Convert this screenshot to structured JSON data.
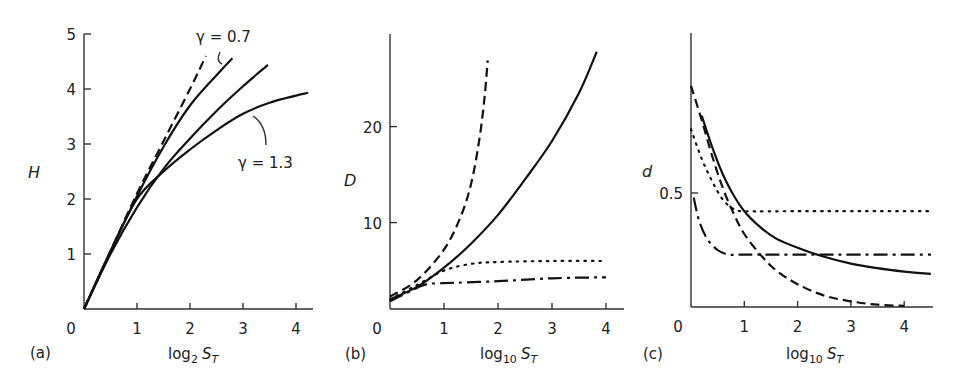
{
  "chart_data": [
    {
      "panel": "(a)",
      "type": "line",
      "xlabel": "log2 ST",
      "xlabel_main": "log",
      "xlabel_sub": "2",
      "xlabel_var": "S",
      "xlabel_var_sub": "T",
      "ylabel": "H",
      "xlim": [
        0,
        4.3
      ],
      "ylim": [
        0,
        5
      ],
      "xticks": [
        0,
        1,
        2,
        3,
        4
      ],
      "yticks": [
        1,
        2,
        3,
        4,
        5
      ],
      "grid": false,
      "annotations": [
        {
          "text": "γ = 0.7",
          "x": 2.1,
          "y": 5.0
        },
        {
          "text": "γ = 1.3",
          "x": 3.3,
          "y": 2.6
        }
      ],
      "series": [
        {
          "name": "dashed",
          "style": "dashed",
          "x": [
            0,
            0.5,
            1.0,
            1.5,
            2.0,
            2.3
          ],
          "y": [
            0,
            1.05,
            2.1,
            3.05,
            4.0,
            4.6
          ]
        },
        {
          "name": "γ = 0.7",
          "style": "solid",
          "x": [
            0,
            0.5,
            1.0,
            1.5,
            2.0,
            2.5,
            2.8
          ],
          "y": [
            0,
            1.05,
            2.05,
            2.95,
            3.7,
            4.25,
            4.56
          ]
        },
        {
          "name": "γ = 1.0",
          "style": "solid",
          "x": [
            0,
            0.5,
            1.0,
            1.5,
            2.0,
            2.5,
            3.0,
            3.47
          ],
          "y": [
            0,
            1.0,
            1.85,
            2.55,
            3.1,
            3.6,
            4.05,
            4.44
          ]
        },
        {
          "name": "γ = 1.3",
          "style": "solid",
          "x": [
            0,
            0.5,
            1.0,
            1.5,
            2.0,
            2.5,
            3.0,
            3.5,
            4.0,
            4.23
          ],
          "y": [
            0,
            1.05,
            2.0,
            2.5,
            2.9,
            3.25,
            3.55,
            3.75,
            3.88,
            3.93
          ]
        }
      ]
    },
    {
      "panel": "(b)",
      "type": "line",
      "xlabel": "log10 ST",
      "xlabel_main": "log",
      "xlabel_sub": "10",
      "xlabel_var": "S",
      "xlabel_var_sub": "T",
      "ylabel": "D",
      "xlim": [
        0,
        4.3
      ],
      "ylim": [
        1,
        30
      ],
      "xticks": [
        0,
        1,
        2,
        3,
        4
      ],
      "yticks": [
        10,
        20
      ],
      "grid": false,
      "series": [
        {
          "name": "dashed",
          "style": "dashed",
          "x": [
            0,
            0.5,
            1.0,
            1.3,
            1.5,
            1.65,
            1.75,
            1.81
          ],
          "y": [
            2.3,
            4.0,
            7.2,
            10.5,
            14.0,
            18.5,
            23.0,
            26.9
          ]
        },
        {
          "name": "solid",
          "style": "solid",
          "x": [
            0,
            0.5,
            1.0,
            1.5,
            2.0,
            2.5,
            3.0,
            3.5,
            3.83
          ],
          "y": [
            2.0,
            3.3,
            5.3,
            7.8,
            10.8,
            14.5,
            18.5,
            23.5,
            27.8
          ]
        },
        {
          "name": "dotted",
          "style": "dotted",
          "x": [
            0,
            0.5,
            1.0,
            1.5,
            2.0,
            3.0,
            4.0
          ],
          "y": [
            2.0,
            3.5,
            5.0,
            5.7,
            5.9,
            6.0,
            6.0
          ]
        },
        {
          "name": "dash-dot",
          "style": "dashdot",
          "x": [
            0,
            0.5,
            0.7,
            1.0,
            2.0,
            3.0,
            4.0
          ],
          "y": [
            1.8,
            3.2,
            3.6,
            3.7,
            3.9,
            4.2,
            4.3
          ]
        }
      ]
    },
    {
      "panel": "(c)",
      "type": "line",
      "xlabel": "log10 ST",
      "xlabel_main": "log",
      "xlabel_sub": "10",
      "xlabel_var": "S",
      "xlabel_var_sub": "T",
      "ylabel": "d",
      "xlim": [
        0,
        4.5
      ],
      "ylim": [
        0,
        1.2
      ],
      "xticks": [
        0,
        1,
        2,
        3,
        4
      ],
      "yticks": [
        0.5
      ],
      "grid": false,
      "series": [
        {
          "name": "solid",
          "style": "solid",
          "x": [
            0.2,
            0.4,
            0.6,
            0.8,
            1.0,
            1.3,
            1.6,
            2.0,
            2.5,
            3.0,
            3.5,
            4.0,
            4.5
          ],
          "y": [
            0.84,
            0.7,
            0.58,
            0.49,
            0.42,
            0.35,
            0.3,
            0.26,
            0.22,
            0.19,
            0.17,
            0.155,
            0.145
          ]
        },
        {
          "name": "dashed",
          "style": "dashed",
          "x": [
            0,
            0.2,
            0.4,
            0.6,
            0.8,
            1.0,
            1.3,
            1.6,
            2.0,
            2.5,
            3.0,
            3.5,
            4.0
          ],
          "y": [
            0.97,
            0.82,
            0.66,
            0.52,
            0.41,
            0.32,
            0.23,
            0.16,
            0.1,
            0.05,
            0.025,
            0.01,
            0.005
          ]
        },
        {
          "name": "dotted",
          "style": "dotted",
          "x": [
            0,
            0.2,
            0.4,
            0.6,
            0.8,
            1.0,
            2.0,
            3.0,
            4.5
          ],
          "y": [
            0.78,
            0.65,
            0.55,
            0.47,
            0.43,
            0.42,
            0.42,
            0.42,
            0.42
          ]
        },
        {
          "name": "dash-dot",
          "style": "dashdot",
          "x": [
            0.05,
            0.15,
            0.3,
            0.5,
            0.7,
            0.9,
            1.2,
            2.0,
            3.0,
            4.5
          ],
          "y": [
            0.48,
            0.38,
            0.3,
            0.25,
            0.23,
            0.23,
            0.23,
            0.23,
            0.23,
            0.23
          ]
        }
      ]
    }
  ],
  "panels": [
    {
      "label": "(a)",
      "ylabel": "H",
      "xlabel_main": "log",
      "xlabel_sub": "2",
      "xlabel_var": "S",
      "xlabel_var_sub": "T"
    },
    {
      "label": "(b)",
      "ylabel": "D",
      "xlabel_main": "log",
      "xlabel_sub": "10",
      "xlabel_var": "S",
      "xlabel_var_sub": "T"
    },
    {
      "label": "(c)",
      "ylabel": "d",
      "xlabel_main": "log",
      "xlabel_sub": "10",
      "xlabel_var": "S",
      "xlabel_var_sub": "T"
    }
  ],
  "annotations": {
    "a_gamma_low": "γ = 0.7",
    "a_gamma_high": "γ = 1.3"
  }
}
